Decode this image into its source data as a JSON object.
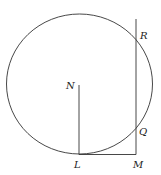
{
  "diagram": {
    "type": "geometry",
    "shapes": {
      "circle": {
        "cx": 79.5,
        "cy": 84,
        "rx": 73,
        "ry": 70
      },
      "segments": [
        {
          "name": "NL",
          "from": "N",
          "to": "L"
        },
        {
          "name": "LM",
          "from": "L",
          "to": "M"
        },
        {
          "name": "vertical-line-through-M",
          "from": "M",
          "to": "top"
        }
      ]
    },
    "points": {
      "N": {
        "label": "N",
        "x": 79,
        "y": 85
      },
      "L": {
        "label": "L",
        "x": 79,
        "y": 154
      },
      "M": {
        "label": "M",
        "x": 136,
        "y": 154
      },
      "Q": {
        "label": "Q",
        "x": 136,
        "y": 127
      },
      "R": {
        "label": "R",
        "x": 136,
        "y": 40
      }
    },
    "colors": {
      "stroke": "#333333",
      "text": "#222222"
    }
  }
}
